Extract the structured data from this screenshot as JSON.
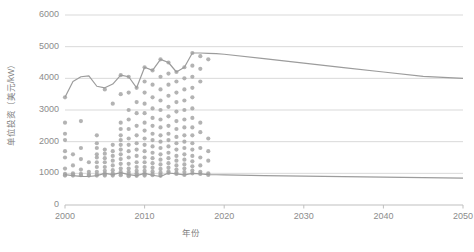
{
  "chart_data": {
    "type": "scatter",
    "title": "",
    "xlabel": "年份",
    "ylabel": "单位投资（美元/kW）",
    "xlim": [
      2000,
      2050
    ],
    "ylim": [
      0,
      6000
    ],
    "grid": true,
    "legend": "none",
    "xticks": [
      "2000",
      "2010",
      "2020",
      "2030",
      "2040",
      "2050"
    ],
    "xtick_values": [
      2000,
      2010,
      2020,
      2030,
      2040,
      2050
    ],
    "yticks": [
      "0",
      "1000",
      "2000",
      "3000",
      "4000",
      "5000",
      "6000"
    ],
    "ytick_values": [
      0,
      1000,
      2000,
      3000,
      4000,
      5000,
      6000
    ],
    "colors": {
      "point": "#a6a6a6",
      "line": "#9c9c9c",
      "grid": "#d9d9d9",
      "axis": "#bfbfbf",
      "text": "#808080"
    },
    "series": [
      {
        "name": "upper-bound-line",
        "type": "line",
        "x": [
          2000,
          2001,
          2002,
          2003,
          2004,
          2005,
          2006,
          2007,
          2008,
          2009,
          2010,
          2011,
          2012,
          2013,
          2014,
          2015,
          2016,
          2017,
          2018,
          2019,
          2020,
          2025,
          2030,
          2035,
          2040,
          2045,
          2050
        ],
        "values": [
          3400,
          3900,
          4050,
          4080,
          3750,
          3700,
          3820,
          4100,
          4050,
          3700,
          4350,
          4250,
          4600,
          4500,
          4200,
          4350,
          4800,
          4800,
          4790,
          4780,
          4760,
          4620,
          4480,
          4340,
          4200,
          4060,
          4000
        ]
      },
      {
        "name": "lower-bound-line",
        "type": "line",
        "x": [
          2000,
          2001,
          2002,
          2003,
          2004,
          2005,
          2006,
          2007,
          2008,
          2009,
          2010,
          2011,
          2012,
          2013,
          2014,
          2015,
          2016,
          2017,
          2018,
          2019,
          2020,
          2025,
          2030,
          2035,
          2040,
          2045,
          2050
        ],
        "values": [
          960,
          930,
          905,
          900,
          930,
          1000,
          960,
          1020,
          960,
          930,
          1000,
          940,
          900,
          1010,
          980,
          950,
          1000,
          980,
          960,
          955,
          950,
          930,
          915,
          895,
          880,
          865,
          850
        ]
      },
      {
        "name": "project-unit-investment-points",
        "type": "scatter",
        "points": [
          [
            2000,
            3400
          ],
          [
            2000,
            2600
          ],
          [
            2000,
            2250
          ],
          [
            2000,
            2050
          ],
          [
            2000,
            1700
          ],
          [
            2000,
            1500
          ],
          [
            2000,
            1150
          ],
          [
            2000,
            980
          ],
          [
            2000,
            950
          ],
          [
            2000,
            930
          ],
          [
            2001,
            1600
          ],
          [
            2001,
            1250
          ],
          [
            2001,
            1000
          ],
          [
            2001,
            960
          ],
          [
            2001,
            930
          ],
          [
            2002,
            2650
          ],
          [
            2002,
            1800
          ],
          [
            2002,
            1450
          ],
          [
            2002,
            1120
          ],
          [
            2002,
            980
          ],
          [
            2002,
            940
          ],
          [
            2003,
            1350
          ],
          [
            2003,
            1050
          ],
          [
            2003,
            960
          ],
          [
            2003,
            930
          ],
          [
            2004,
            2200
          ],
          [
            2004,
            1950
          ],
          [
            2004,
            1800
          ],
          [
            2004,
            1600
          ],
          [
            2004,
            1500
          ],
          [
            2004,
            1350
          ],
          [
            2004,
            1200
          ],
          [
            2004,
            1050
          ],
          [
            2004,
            960
          ],
          [
            2004,
            930
          ],
          [
            2005,
            3650
          ],
          [
            2005,
            1750
          ],
          [
            2005,
            1620
          ],
          [
            2005,
            1480
          ],
          [
            2005,
            1350
          ],
          [
            2005,
            1200
          ],
          [
            2005,
            1080
          ],
          [
            2005,
            1000
          ],
          [
            2005,
            960
          ],
          [
            2005,
            930
          ],
          [
            2006,
            3200
          ],
          [
            2006,
            1900
          ],
          [
            2006,
            1700
          ],
          [
            2006,
            1550
          ],
          [
            2006,
            1400
          ],
          [
            2006,
            1250
          ],
          [
            2006,
            1100
          ],
          [
            2006,
            1000
          ],
          [
            2006,
            960
          ],
          [
            2006,
            930
          ],
          [
            2007,
            4100
          ],
          [
            2007,
            3500
          ],
          [
            2007,
            2600
          ],
          [
            2007,
            2400
          ],
          [
            2007,
            2200
          ],
          [
            2007,
            2050
          ],
          [
            2007,
            1900
          ],
          [
            2007,
            1750
          ],
          [
            2007,
            1600
          ],
          [
            2007,
            1450
          ],
          [
            2007,
            1300
          ],
          [
            2007,
            1150
          ],
          [
            2007,
            1050
          ],
          [
            2007,
            980
          ],
          [
            2007,
            940
          ],
          [
            2008,
            4050
          ],
          [
            2008,
            3550
          ],
          [
            2008,
            3000
          ],
          [
            2008,
            2700
          ],
          [
            2008,
            2400
          ],
          [
            2008,
            2100
          ],
          [
            2008,
            1900
          ],
          [
            2008,
            1700
          ],
          [
            2008,
            1500
          ],
          [
            2008,
            1300
          ],
          [
            2008,
            1150
          ],
          [
            2008,
            1050
          ],
          [
            2008,
            980
          ],
          [
            2008,
            940
          ],
          [
            2008,
            910
          ],
          [
            2009,
            3700
          ],
          [
            2009,
            3250
          ],
          [
            2009,
            2900
          ],
          [
            2009,
            2500
          ],
          [
            2009,
            2200
          ],
          [
            2009,
            1950
          ],
          [
            2009,
            1750
          ],
          [
            2009,
            1550
          ],
          [
            2009,
            1350
          ],
          [
            2009,
            1200
          ],
          [
            2009,
            1080
          ],
          [
            2009,
            1000
          ],
          [
            2009,
            950
          ],
          [
            2009,
            920
          ],
          [
            2010,
            4350
          ],
          [
            2010,
            3900
          ],
          [
            2010,
            3550
          ],
          [
            2010,
            3200
          ],
          [
            2010,
            2900
          ],
          [
            2010,
            2600
          ],
          [
            2010,
            2350
          ],
          [
            2010,
            2100
          ],
          [
            2010,
            1900
          ],
          [
            2010,
            1700
          ],
          [
            2010,
            1500
          ],
          [
            2010,
            1350
          ],
          [
            2010,
            1200
          ],
          [
            2010,
            1080
          ],
          [
            2010,
            1000
          ],
          [
            2010,
            960
          ],
          [
            2010,
            930
          ],
          [
            2011,
            4250
          ],
          [
            2011,
            3800
          ],
          [
            2011,
            3400
          ],
          [
            2011,
            3050
          ],
          [
            2011,
            2750
          ],
          [
            2011,
            2500
          ],
          [
            2011,
            2250
          ],
          [
            2011,
            2050
          ],
          [
            2011,
            1850
          ],
          [
            2011,
            1650
          ],
          [
            2011,
            1480
          ],
          [
            2011,
            1320
          ],
          [
            2011,
            1180
          ],
          [
            2011,
            1060
          ],
          [
            2011,
            980
          ],
          [
            2011,
            940
          ],
          [
            2012,
            4600
          ],
          [
            2012,
            4050
          ],
          [
            2012,
            3650
          ],
          [
            2012,
            3300
          ],
          [
            2012,
            3000
          ],
          [
            2012,
            2700
          ],
          [
            2012,
            2450
          ],
          [
            2012,
            2200
          ],
          [
            2012,
            2000
          ],
          [
            2012,
            1800
          ],
          [
            2012,
            1600
          ],
          [
            2012,
            1430
          ],
          [
            2012,
            1280
          ],
          [
            2012,
            1140
          ],
          [
            2012,
            1030
          ],
          [
            2012,
            960
          ],
          [
            2012,
            920
          ],
          [
            2013,
            4500
          ],
          [
            2013,
            4150
          ],
          [
            2013,
            3800
          ],
          [
            2013,
            3450
          ],
          [
            2013,
            3100
          ],
          [
            2013,
            2800
          ],
          [
            2013,
            2500
          ],
          [
            2013,
            2250
          ],
          [
            2013,
            2050
          ],
          [
            2013,
            1850
          ],
          [
            2013,
            1650
          ],
          [
            2013,
            1480
          ],
          [
            2013,
            1320
          ],
          [
            2013,
            1180
          ],
          [
            2013,
            1060
          ],
          [
            2013,
            1010
          ],
          [
            2014,
            4200
          ],
          [
            2014,
            3900
          ],
          [
            2014,
            3550
          ],
          [
            2014,
            3250
          ],
          [
            2014,
            2950
          ],
          [
            2014,
            2650
          ],
          [
            2014,
            2400
          ],
          [
            2014,
            2150
          ],
          [
            2014,
            1950
          ],
          [
            2014,
            1750
          ],
          [
            2014,
            1550
          ],
          [
            2014,
            1400
          ],
          [
            2014,
            1250
          ],
          [
            2014,
            1120
          ],
          [
            2014,
            1020
          ],
          [
            2014,
            980
          ],
          [
            2015,
            4350
          ],
          [
            2015,
            4000
          ],
          [
            2015,
            3650
          ],
          [
            2015,
            3300
          ],
          [
            2015,
            3000
          ],
          [
            2015,
            2700
          ],
          [
            2015,
            2450
          ],
          [
            2015,
            2200
          ],
          [
            2015,
            2000
          ],
          [
            2015,
            1800
          ],
          [
            2015,
            1600
          ],
          [
            2015,
            1430
          ],
          [
            2015,
            1280
          ],
          [
            2015,
            1150
          ],
          [
            2015,
            1040
          ],
          [
            2015,
            950
          ],
          [
            2016,
            4800
          ],
          [
            2016,
            4400
          ],
          [
            2016,
            4050
          ],
          [
            2016,
            3700
          ],
          [
            2016,
            3400
          ],
          [
            2016,
            3050
          ],
          [
            2016,
            2750
          ],
          [
            2016,
            2450
          ],
          [
            2016,
            2200
          ],
          [
            2016,
            1950
          ],
          [
            2016,
            1750
          ],
          [
            2016,
            1550
          ],
          [
            2016,
            1380
          ],
          [
            2016,
            1220
          ],
          [
            2016,
            1090
          ],
          [
            2016,
            1000
          ],
          [
            2017,
            4700
          ],
          [
            2017,
            4300
          ],
          [
            2017,
            3900
          ],
          [
            2017,
            2600
          ],
          [
            2017,
            2300
          ],
          [
            2017,
            1800
          ],
          [
            2017,
            1500
          ],
          [
            2017,
            1250
          ],
          [
            2017,
            1050
          ],
          [
            2017,
            980
          ],
          [
            2018,
            4600
          ],
          [
            2018,
            2100
          ],
          [
            2018,
            1700
          ],
          [
            2018,
            1400
          ],
          [
            2018,
            1000
          ],
          [
            2018,
            950
          ]
        ]
      }
    ]
  },
  "axes": {
    "y_tick_labels": [
      "6000",
      "5000",
      "4000",
      "3000",
      "2000",
      "1000",
      "0"
    ],
    "x_tick_labels": [
      "2000",
      "2010",
      "2020",
      "2030",
      "2040",
      "2050"
    ],
    "y_axis_title": "单位投资（美元/kW）",
    "x_axis_title": "年份"
  }
}
